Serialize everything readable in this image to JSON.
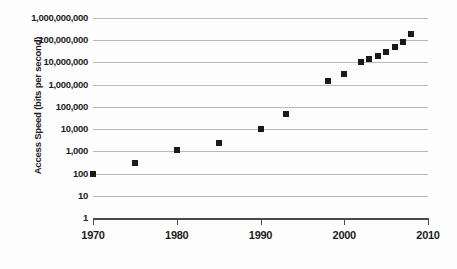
{
  "chart_data": {
    "type": "scatter",
    "title": "",
    "xlabel": "",
    "ylabel": "Access Speed (bits per second)",
    "xlim": [
      1970,
      2010
    ],
    "ylim": [
      1,
      1000000000
    ],
    "yscale": "log",
    "xscale": "linear",
    "grid": true,
    "legend": false,
    "marker": "square",
    "marker_color": "#1a1a1a",
    "gridline_color": "#b9b9b9",
    "axis_color": "#4a4a4a",
    "x_ticks": [
      1970,
      1980,
      1990,
      2000,
      2010
    ],
    "x_tick_labels": [
      "1970",
      "1980",
      "1990",
      "2000",
      "2010"
    ],
    "y_ticks": [
      1,
      10,
      100,
      1000,
      10000,
      100000,
      1000000,
      10000000,
      100000000,
      1000000000
    ],
    "y_tick_labels": [
      "1,000,000,000",
      "100,000,000",
      "10,000,000",
      "1,000,000",
      "100,000",
      "10,000",
      "1,000",
      "100",
      "10",
      "1"
    ],
    "x": [
      1970,
      1975,
      1980,
      1985,
      1990,
      1993,
      1998,
      2000,
      2002,
      2003,
      2004,
      2005,
      2006,
      2007,
      2008
    ],
    "y": [
      100,
      300,
      1200,
      2400,
      10000,
      50000,
      1500000,
      3000000,
      10000000,
      14000000,
      20000000,
      30000000,
      50000000,
      80000000,
      200000000
    ],
    "points": [
      {
        "x": 1970,
        "y": 100
      },
      {
        "x": 1975,
        "y": 300
      },
      {
        "x": 1980,
        "y": 1200
      },
      {
        "x": 1985,
        "y": 2400
      },
      {
        "x": 1990,
        "y": 10000
      },
      {
        "x": 1993,
        "y": 50000
      },
      {
        "x": 1998,
        "y": 1500000
      },
      {
        "x": 2000,
        "y": 3000000
      },
      {
        "x": 2002,
        "y": 10000000
      },
      {
        "x": 2003,
        "y": 14000000
      },
      {
        "x": 2004,
        "y": 20000000
      },
      {
        "x": 2005,
        "y": 30000000
      },
      {
        "x": 2006,
        "y": 50000000
      },
      {
        "x": 2007,
        "y": 80000000
      },
      {
        "x": 2008,
        "y": 200000000
      }
    ]
  },
  "caption": {
    "partial_text": ""
  }
}
